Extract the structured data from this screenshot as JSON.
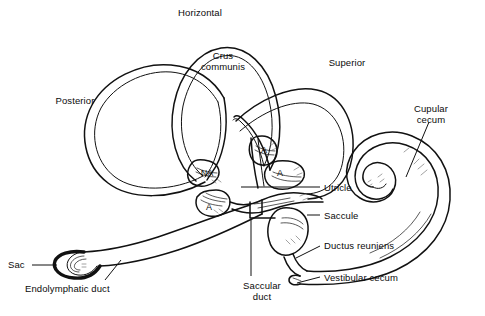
{
  "figure": {
    "type": "anatomical-line-diagram",
    "background_color": "#ffffff",
    "stroke_color": "#111111",
    "shading_color": "#8a8a8a",
    "width": 485,
    "height": 316
  },
  "labels": {
    "horizontal": {
      "text": "Horizontal",
      "x": 200,
      "y": 7,
      "align": "center"
    },
    "crus_communis": {
      "text": "Crus\ncommunis",
      "x": 223,
      "y": 50,
      "align": "center"
    },
    "superior": {
      "text": "Superior",
      "x": 347,
      "y": 57,
      "align": "center"
    },
    "posterior": {
      "text": "Posterior",
      "x": 75,
      "y": 95,
      "align": "center"
    },
    "cupular_cecum": {
      "text": "Cupular\ncecum",
      "x": 431,
      "y": 103,
      "align": "center"
    },
    "utricle": {
      "text": "Utricle",
      "x": 324,
      "y": 189,
      "align": "left"
    },
    "saccule": {
      "text": "Saccule",
      "x": 324,
      "y": 217,
      "align": "left"
    },
    "ductus_reuniens": {
      "text": "Ductus reuniens",
      "x": 324,
      "y": 245,
      "align": "left"
    },
    "vestibular_cecum": {
      "text": "Vestibular cecum",
      "x": 324,
      "y": 279,
      "align": "left"
    },
    "saccular_duct": {
      "text": "Saccular\nduct",
      "x": 262,
      "y": 285,
      "align": "center"
    },
    "sac": {
      "text": "Sac",
      "x": 8,
      "y": 262,
      "align": "left"
    },
    "endolymphatic_duct": {
      "text": "Endolymphatic duct",
      "x": 25,
      "y": 289,
      "align": "left"
    }
  },
  "ampulla_marks": [
    {
      "text": "NA",
      "x": 207,
      "y": 173
    },
    {
      "text": "A",
      "x": 209,
      "y": 207
    },
    {
      "text": "A",
      "x": 264,
      "y": 150
    },
    {
      "text": "A",
      "x": 280,
      "y": 173
    }
  ],
  "legend_notes": {
    "A": "ampulla",
    "NA": "non-ampullated end"
  }
}
